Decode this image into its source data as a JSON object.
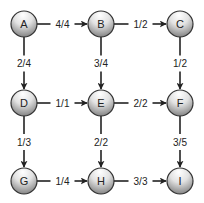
{
  "diagram": {
    "type": "flow-network",
    "colors": {
      "edge": "#222222",
      "node_stroke": "#333333",
      "node_fill_top": "#ffffff",
      "node_fill_bottom": "#8a8a8a",
      "background": "#ffffff"
    },
    "nodes": [
      {
        "id": "A",
        "label": "A",
        "x": 24,
        "y": 24
      },
      {
        "id": "B",
        "label": "B",
        "x": 101,
        "y": 24
      },
      {
        "id": "C",
        "label": "C",
        "x": 180,
        "y": 24
      },
      {
        "id": "D",
        "label": "D",
        "x": 24,
        "y": 103
      },
      {
        "id": "E",
        "label": "E",
        "x": 101,
        "y": 103
      },
      {
        "id": "F",
        "label": "F",
        "x": 180,
        "y": 103
      },
      {
        "id": "G",
        "label": "G",
        "x": 24,
        "y": 181
      },
      {
        "id": "H",
        "label": "H",
        "x": 101,
        "y": 181
      },
      {
        "id": "I",
        "label": "I",
        "x": 180,
        "y": 181
      }
    ],
    "edges": [
      {
        "from": "A",
        "to": "B",
        "label": "4/4"
      },
      {
        "from": "B",
        "to": "C",
        "label": "1/2"
      },
      {
        "from": "A",
        "to": "D",
        "label": "2/4"
      },
      {
        "from": "B",
        "to": "E",
        "label": "3/4"
      },
      {
        "from": "C",
        "to": "F",
        "label": "1/2"
      },
      {
        "from": "D",
        "to": "E",
        "label": "1/1"
      },
      {
        "from": "E",
        "to": "F",
        "label": "2/2"
      },
      {
        "from": "D",
        "to": "G",
        "label": "1/3"
      },
      {
        "from": "E",
        "to": "H",
        "label": "2/2"
      },
      {
        "from": "F",
        "to": "I",
        "label": "3/5"
      },
      {
        "from": "G",
        "to": "H",
        "label": "1/4"
      },
      {
        "from": "H",
        "to": "I",
        "label": "3/3"
      }
    ]
  }
}
